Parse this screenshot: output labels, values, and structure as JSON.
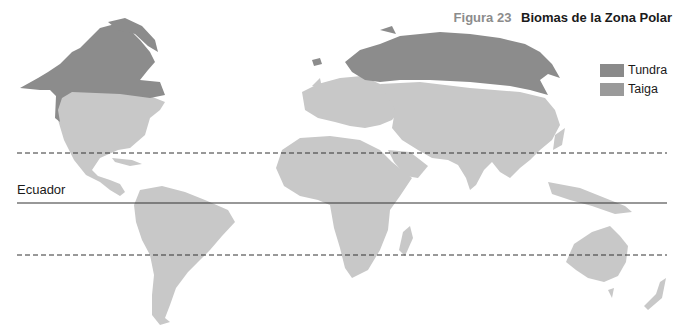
{
  "title": {
    "figure_label": "Figura 23",
    "text": "Biomas de la Zona Polar"
  },
  "legend": {
    "items": [
      {
        "label": "Tundra",
        "color": "#8a8a8a"
      },
      {
        "label": "Taiga",
        "color": "#9a9a9a"
      }
    ]
  },
  "lines": {
    "equator_label": "Ecuador",
    "tropic_north_y": 153,
    "equator_y": 203,
    "tropic_south_y": 255
  },
  "colors": {
    "land": "#c8c8c8",
    "polar_biome": "#8c8c8c",
    "line": "#333333"
  }
}
